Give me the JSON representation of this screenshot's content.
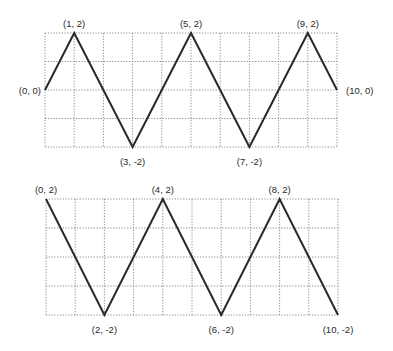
{
  "chart_data": [
    {
      "type": "line",
      "title": "",
      "xlabel": "",
      "ylabel": "",
      "xlim": [
        0,
        10
      ],
      "ylim": [
        -2,
        2
      ],
      "grid": true,
      "grid_style": "dotted",
      "legend": null,
      "series": [
        {
          "name": "triangle-wave-1",
          "x": [
            0,
            1,
            3,
            5,
            7,
            9,
            10
          ],
          "y": [
            0,
            2,
            -2,
            2,
            -2,
            2,
            0
          ]
        }
      ],
      "annotations": [
        {
          "text": "(0, 0)",
          "x": 0,
          "y": 0,
          "pos": "left"
        },
        {
          "text": "(1, 2)",
          "x": 1,
          "y": 2,
          "pos": "above"
        },
        {
          "text": "(3, -2)",
          "x": 3,
          "y": -2,
          "pos": "below"
        },
        {
          "text": "(5, 2)",
          "x": 5,
          "y": 2,
          "pos": "above"
        },
        {
          "text": "(7, -2)",
          "x": 7,
          "y": -2,
          "pos": "below"
        },
        {
          "text": "(9, 2)",
          "x": 9,
          "y": 2,
          "pos": "above"
        },
        {
          "text": "(10, 0)",
          "x": 10,
          "y": 0,
          "pos": "right"
        }
      ],
      "frame": {
        "left": 45,
        "top": 33,
        "right": 337,
        "bottom": 147
      }
    },
    {
      "type": "line",
      "title": "",
      "xlabel": "",
      "ylabel": "",
      "xlim": [
        0,
        10
      ],
      "ylim": [
        -2,
        2
      ],
      "grid": true,
      "grid_style": "dotted",
      "legend": null,
      "series": [
        {
          "name": "triangle-wave-2",
          "x": [
            0,
            2,
            4,
            6,
            8,
            10
          ],
          "y": [
            2,
            -2,
            2,
            -2,
            2,
            -2
          ]
        }
      ],
      "annotations": [
        {
          "text": "(0, 2)",
          "x": 0,
          "y": 2,
          "pos": "above"
        },
        {
          "text": "(2, -2)",
          "x": 2,
          "y": -2,
          "pos": "below"
        },
        {
          "text": "(4, 2)",
          "x": 4,
          "y": 2,
          "pos": "above"
        },
        {
          "text": "(6, -2)",
          "x": 6,
          "y": -2,
          "pos": "below"
        },
        {
          "text": "(8, 2)",
          "x": 8,
          "y": 2,
          "pos": "above"
        },
        {
          "text": "(10, -2)",
          "x": 10,
          "y": -2,
          "pos": "below"
        }
      ],
      "frame": {
        "left": 46,
        "top": 199,
        "right": 338,
        "bottom": 315
      }
    }
  ],
  "colors": {
    "background": "#ffffff",
    "line": "#2a2a2a",
    "grid": "#8a8a8a",
    "label": "#2b2b2b"
  }
}
